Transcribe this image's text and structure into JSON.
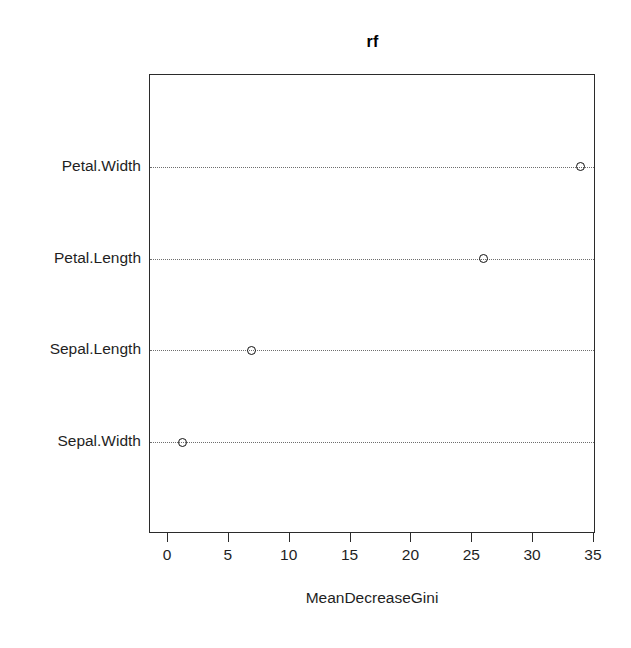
{
  "chart_data": {
    "type": "scatter",
    "title": "rf",
    "xlabel": "MeanDecreaseGini",
    "ylabel": "",
    "xlim": [
      -1.2,
      35.5
    ],
    "grid": true,
    "legend": null,
    "xticks": [
      {
        "value": 0,
        "label": "0"
      },
      {
        "value": 5,
        "label": "5"
      },
      {
        "value": 10,
        "label": "10"
      },
      {
        "value": 15,
        "label": "15"
      },
      {
        "value": 20,
        "label": "20"
      },
      {
        "value": 25,
        "label": "25"
      },
      {
        "value": 30,
        "label": "30"
      },
      {
        "value": 35,
        "label": "35"
      }
    ],
    "categories": [
      "Petal.Width",
      "Petal.Length",
      "Sepal.Length",
      "Sepal.Width"
    ],
    "values": [
      33.9,
      25.9,
      6.9,
      1.2
    ],
    "points": [
      {
        "label": "Petal.Width",
        "value": 33.9
      },
      {
        "label": "Petal.Length",
        "value": 25.9
      },
      {
        "label": "Sepal.Length",
        "value": 6.9
      },
      {
        "label": "Sepal.Width",
        "value": 1.2
      }
    ],
    "marker": "open-circle",
    "marker_color": "#111111",
    "gridline_style": "dotted",
    "panel_border_color": "#2b2b2b",
    "background": "#ffffff"
  }
}
